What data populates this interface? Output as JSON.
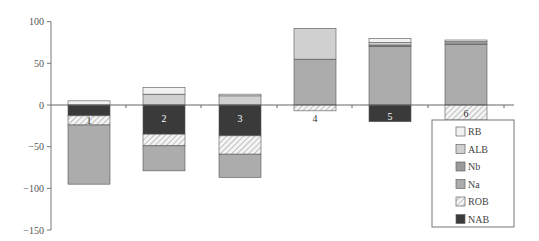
{
  "chart_data": {
    "type": "bar",
    "subtype": "stacked-diverging",
    "title": "",
    "xlabel": "",
    "ylabel": "",
    "ylim": [
      -150,
      100
    ],
    "yticks": [
      100,
      50,
      0,
      -50,
      -100,
      -150
    ],
    "ytick_labels": [
      "100",
      "50",
      "0",
      "−50",
      "−100",
      "−150"
    ],
    "categories": [
      "1",
      "2",
      "3",
      "4",
      "5",
      "6"
    ],
    "grid": false,
    "legend_position": "bottom-right",
    "series": [
      {
        "name": "RB",
        "fill": "#f2f2f2",
        "pattern": "solid",
        "values": [
          5,
          8,
          2,
          0,
          5,
          2
        ]
      },
      {
        "name": "ALB",
        "fill": "#d0d0d0",
        "pattern": "solid",
        "values": [
          0,
          13,
          11,
          37,
          3,
          0
        ]
      },
      {
        "name": "Nb",
        "fill": "#9a9a9a",
        "pattern": "solid",
        "values": [
          0,
          0,
          0,
          0,
          2,
          3
        ]
      },
      {
        "name": "Na",
        "fill": "#acacac",
        "pattern": "solid",
        "values": [
          -71,
          -30,
          -28,
          55,
          70,
          73
        ]
      },
      {
        "name": "ROB",
        "fill": "#e6e6e6",
        "pattern": "hatch",
        "values": [
          -11,
          -14,
          -22,
          -7,
          0,
          -18
        ]
      },
      {
        "name": "NAB",
        "fill": "#3a3a3a",
        "pattern": "solid",
        "values": [
          -13,
          -35,
          -37,
          0,
          -20,
          0
        ]
      }
    ],
    "stack_order_positive": [
      "Na",
      "Nb",
      "ALB",
      "RB"
    ],
    "stack_order_negative": [
      "NAB",
      "ROB",
      "Na"
    ],
    "legend_entries": [
      "RB",
      "ALB",
      "Nb",
      "Na",
      "ROB",
      "NAB"
    ]
  }
}
